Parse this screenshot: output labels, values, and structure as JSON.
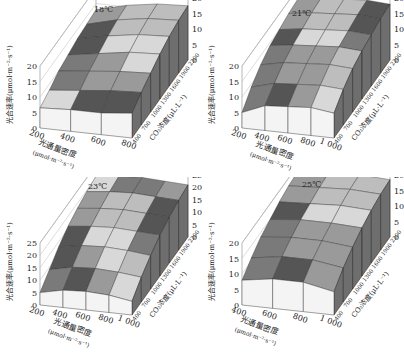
{
  "chart_data": [
    {
      "type": "surface3d",
      "title": "18℃",
      "xlabel": "光通量密度 (μmol·m⁻²·s⁻¹)",
      "ylabel": "CO₂浓度 (μL·L⁻¹)",
      "zlabel": "光合速率 (μmol·m⁻²·s⁻¹)",
      "x": [
        "200",
        "400",
        "600",
        "800"
      ],
      "y": [
        "400",
        "700",
        "1000",
        "1300",
        "1600",
        "1900",
        "2200"
      ],
      "zlim": [
        0,
        20
      ],
      "zticks": [
        "0",
        "5",
        "10",
        "15",
        "20"
      ],
      "z": [
        [
          6.5,
          8,
          10,
          11,
          12,
          12.5,
          13
        ],
        [
          7,
          9,
          11,
          12.5,
          14,
          15,
          15.5
        ],
        [
          7,
          10,
          12,
          14,
          15.5,
          16.5,
          17
        ],
        [
          8,
          10.5,
          12.5,
          14.5,
          16,
          17,
          17.5
        ]
      ]
    },
    {
      "type": "surface3d",
      "title": "21℃",
      "xlabel": "光通量密度 (μmol·m⁻²·s⁻¹)",
      "ylabel": "CO₂浓度 (μL·L⁻¹)",
      "zlabel": "光合速率 (μmol·m⁻²·s⁻¹)",
      "x": [
        "200",
        "400",
        "600",
        "800",
        "1 000"
      ],
      "y": [
        "400",
        "700",
        "1000",
        "1300",
        "1600",
        "1900",
        "2200"
      ],
      "zlim": [
        0,
        20
      ],
      "zticks": [
        "0",
        "5",
        "10",
        "15",
        "20"
      ],
      "z": [
        [
          5,
          9,
          12,
          14,
          15,
          16,
          16.5
        ],
        [
          8,
          11,
          13.5,
          15,
          16,
          17,
          17.5
        ],
        [
          8.5,
          11.5,
          14,
          15.5,
          16.5,
          17.5,
          18
        ],
        [
          9,
          12,
          14.5,
          16,
          17,
          18,
          18.5
        ],
        [
          8,
          11.5,
          14,
          15.5,
          16.5,
          17.5,
          18
        ]
      ]
    },
    {
      "type": "surface3d",
      "title": "23℃",
      "xlabel": "光通量密度 (μmol·m⁻²·s⁻¹)",
      "ylabel": "CO₂浓度 (μL·L⁻¹)",
      "zlabel": "光合速率 (μmol·m⁻²·s⁻¹)",
      "x": [
        "200",
        "400",
        "600",
        "800",
        "1 000"
      ],
      "y": [
        "400",
        "700",
        "1000",
        "1300",
        "1600",
        "1900",
        "2200"
      ],
      "zlim": [
        0,
        25
      ],
      "zticks": [
        "0",
        "5",
        "10",
        "15",
        "20",
        "25"
      ],
      "z": [
        [
          5,
          9,
          13,
          16,
          18,
          19.5,
          20.5
        ],
        [
          7,
          11,
          14.5,
          17,
          19,
          20.5,
          21.5
        ],
        [
          7.5,
          11.5,
          15,
          17.5,
          19.5,
          21,
          22
        ],
        [
          7,
          11,
          14.5,
          17,
          19,
          20.5,
          21.5
        ],
        [
          5.5,
          10,
          13.5,
          16.5,
          18.5,
          20,
          21
        ]
      ]
    },
    {
      "type": "surface3d",
      "title": "25℃",
      "xlabel": "光通量密度 (μmol·m⁻²·s⁻¹)",
      "ylabel": "CO₂浓度 (μL·L⁻¹)",
      "zlabel": "光合速率 (μmol·m⁻²·s⁻¹)",
      "x": [
        "400",
        "600",
        "800",
        "1 000"
      ],
      "y": [
        "400",
        "700",
        "1000",
        "1300",
        "1600",
        "1900",
        "2200"
      ],
      "zlim": [
        0,
        20
      ],
      "zticks": [
        "0",
        "5",
        "10",
        "15",
        "20"
      ],
      "z": [
        [
          8,
          11,
          13.5,
          15,
          16.5,
          17.5,
          18
        ],
        [
          9.5,
          12.5,
          14.5,
          16,
          17,
          18,
          18.5
        ],
        [
          9.5,
          12.5,
          14.5,
          16,
          17.5,
          18.5,
          19
        ],
        [
          7.5,
          11,
          13.5,
          15.5,
          17,
          18,
          18.5
        ]
      ]
    }
  ],
  "panels": [
    {
      "title": "18℃"
    },
    {
      "title": "21℃"
    },
    {
      "title": "23℃"
    },
    {
      "title": "25℃"
    }
  ],
  "labels": {
    "zlabel": "光合速率(μmol·m⁻²·s⁻¹)",
    "xlabel_line1": "光通量密度",
    "xlabel_line2": "(μmol·m⁻²·s⁻¹)",
    "ylabel": "CO₂浓度(μL·L⁻¹)"
  },
  "colors": {
    "front_face": "#f4f4f4",
    "side_face": "#6e6e6e",
    "surface_light": "#d8d8d8",
    "surface_mid": "#9a9a9a",
    "surface_dark": "#555555",
    "grid": "#888888",
    "text": "#222222"
  }
}
